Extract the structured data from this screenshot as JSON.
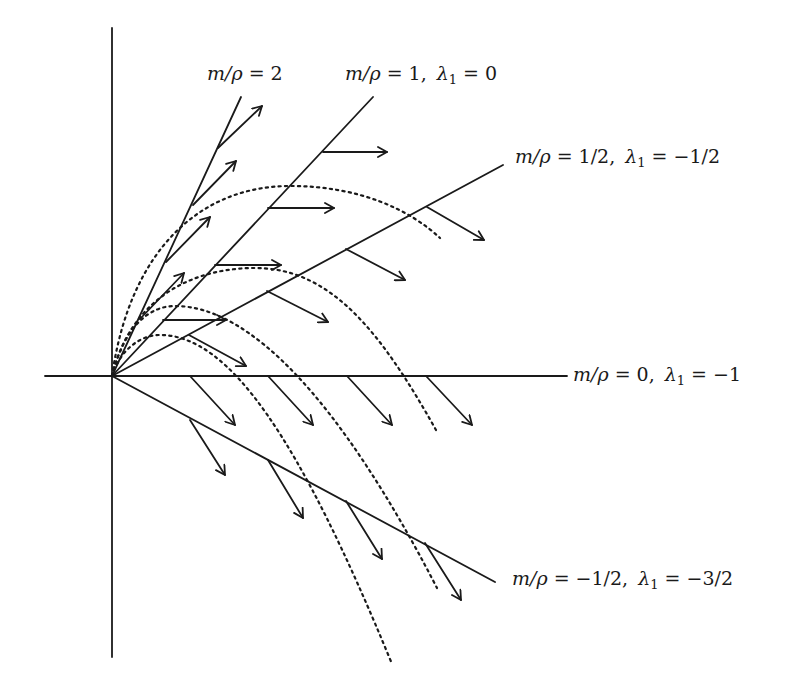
{
  "diagram": {
    "type": "phase-plane vector field",
    "origin": [
      112,
      376
    ],
    "axes": {
      "vertical": {
        "x": 112,
        "y_top": 28,
        "y_bottom": 657
      },
      "horizontal": {
        "y": 376,
        "x_left": 45,
        "x_right": 567
      }
    },
    "rays": [
      {
        "id": "ray-m2",
        "end": [
          241,
          97
        ],
        "label_line1": "m/ρ = 2",
        "label_line2": "",
        "label_pos": [
          207,
          80
        ],
        "arrows": [
          [
            218,
            148,
            262,
            106
          ],
          [
            193,
            205,
            236,
            161
          ],
          [
            166,
            262,
            210,
            217
          ],
          [
            140,
            319,
            184,
            273
          ]
        ]
      },
      {
        "id": "ray-m1",
        "end": [
          373,
          97
        ],
        "label_line1": "m/ρ = 1,",
        "label_line2": "λ₁ = 0",
        "label_pos": [
          345,
          80
        ],
        "arrows": [
          [
            323,
            152,
            387,
            152
          ],
          [
            268,
            208,
            334,
            208
          ],
          [
            215,
            265,
            281,
            265
          ],
          [
            163,
            320,
            226,
            320
          ]
        ]
      },
      {
        "id": "ray-m-half",
        "end": [
          503,
          165
        ],
        "label_line1": "m/ρ = 1/2,",
        "label_line2": "λ₁ = −1/2",
        "label_pos": [
          515,
          163
        ],
        "arrows": [
          [
            427,
            207,
            484,
            240
          ],
          [
            346,
            249,
            405,
            280
          ],
          [
            267,
            291,
            328,
            322
          ],
          [
            189,
            335,
            246,
            366
          ]
        ]
      },
      {
        "id": "ray-m0",
        "end": [
          567,
          376
        ],
        "label_line1": "m/ρ = 0,",
        "label_line2": "λ₁ = −1",
        "label_pos": [
          573,
          381
        ],
        "arrows": [
          [
            190,
            376,
            235,
            425
          ],
          [
            268,
            376,
            313,
            425
          ],
          [
            347,
            376,
            392,
            425
          ],
          [
            426,
            376,
            472,
            425
          ]
        ]
      },
      {
        "id": "ray-m-neg-half",
        "end": [
          495,
          582
        ],
        "label_line1": "m/ρ = −1/2,",
        "label_line2": "λ₁ = −3/2",
        "label_pos": [
          512,
          585
        ],
        "arrows": [
          [
            190,
            420,
            225,
            475
          ],
          [
            268,
            460,
            303,
            518
          ],
          [
            346,
            501,
            382,
            559
          ],
          [
            425,
            543,
            461,
            600
          ]
        ]
      }
    ],
    "trajectories": [
      {
        "id": "traj-1",
        "path": "M112,376 C130,250 200,186 290,186 C360,186 410,210 440,238"
      },
      {
        "id": "traj-2",
        "path": "M112,376 C130,300 190,268 255,268 C330,268 380,330 436,430"
      },
      {
        "id": "traj-3",
        "path": "M112,376 C125,325 150,306 175,306 C250,306 340,400 437,588"
      },
      {
        "id": "traj-4",
        "path": "M112,376 C120,350 140,335 160,335 C230,335 300,440 392,664"
      }
    ]
  },
  "labels": {
    "m2": {
      "lhs": "m/ρ",
      "eq": " = 2"
    },
    "m1": {
      "lhs": "m/ρ",
      "eq": " = 1,",
      "lam": "λ",
      "sub": "1",
      "lam_eq": " = 0"
    },
    "m_half": {
      "lhs": "m/ρ",
      "eq": " = 1/2,",
      "lam": "λ",
      "sub": "1",
      "lam_eq": " = −1/2"
    },
    "m0": {
      "lhs": "m/ρ",
      "eq": " = 0,",
      "lam": "λ",
      "sub": "1",
      "lam_eq": " = −1"
    },
    "m_neg_half": {
      "lhs": "m/ρ",
      "eq": " = −1/2,",
      "lam": "λ",
      "sub": "1",
      "lam_eq": " = −3/2"
    }
  },
  "colors": {
    "ink": "#1a1a1a",
    "background": "#ffffff"
  }
}
